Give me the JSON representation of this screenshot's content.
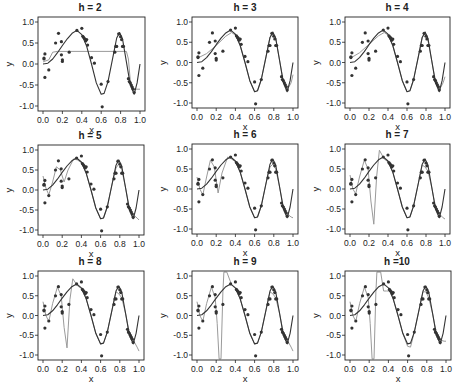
{
  "chart_data": {
    "type": "scatter",
    "layout": {
      "rows": 3,
      "cols": 3,
      "grid": false,
      "legend": "none"
    },
    "shared": {
      "xlabel": "x",
      "ylabel": "y",
      "xlim": [
        0.0,
        1.0
      ],
      "ylim": [
        -1.0,
        1.0
      ],
      "xticks": [
        "0.0",
        "0.2",
        "0.4",
        "0.6",
        "0.8",
        "1.0"
      ],
      "yticks": [
        "1.0",
        "0.5",
        "0.0",
        "-0.5",
        "-1.0"
      ],
      "points": [
        [
          0.01,
          0.14
        ],
        [
          0.01,
          0.12
        ],
        [
          0.02,
          0.24
        ],
        [
          0.02,
          -0.32
        ],
        [
          0.06,
          -0.14
        ],
        [
          0.13,
          0.5
        ],
        [
          0.16,
          0.73
        ],
        [
          0.19,
          0.53
        ],
        [
          0.19,
          0.22
        ],
        [
          0.2,
          0.1
        ],
        [
          0.2,
          0.06
        ],
        [
          0.27,
          0.28
        ],
        [
          0.35,
          0.8
        ],
        [
          0.4,
          0.85
        ],
        [
          0.41,
          0.66
        ],
        [
          0.42,
          0.63
        ],
        [
          0.43,
          0.6
        ],
        [
          0.44,
          0.55
        ],
        [
          0.45,
          0.58
        ],
        [
          0.46,
          0.45
        ],
        [
          0.5,
          0.15
        ],
        [
          0.53,
          0.02
        ],
        [
          0.6,
          -0.48
        ],
        [
          0.61,
          -1.02
        ],
        [
          0.67,
          -0.42
        ],
        [
          0.74,
          0.28
        ],
        [
          0.75,
          0.42
        ],
        [
          0.76,
          0.42
        ],
        [
          0.78,
          0.72
        ],
        [
          0.8,
          0.65
        ],
        [
          0.81,
          0.58
        ],
        [
          0.82,
          0.42
        ],
        [
          0.83,
          0.42
        ],
        [
          0.88,
          -0.35
        ],
        [
          0.89,
          -0.42
        ],
        [
          0.9,
          -0.45
        ],
        [
          0.91,
          -0.5
        ],
        [
          0.92,
          -0.55
        ],
        [
          0.93,
          -0.6
        ],
        [
          0.94,
          -0.68
        ]
      ],
      "true_curve": [
        [
          0.0,
          0.0
        ],
        [
          0.05,
          0.02
        ],
        [
          0.1,
          0.12
        ],
        [
          0.15,
          0.27
        ],
        [
          0.2,
          0.44
        ],
        [
          0.25,
          0.6
        ],
        [
          0.3,
          0.73
        ],
        [
          0.35,
          0.8
        ],
        [
          0.4,
          0.7
        ],
        [
          0.45,
          0.42
        ],
        [
          0.5,
          0.0
        ],
        [
          0.55,
          -0.45
        ],
        [
          0.6,
          -0.72
        ],
        [
          0.63,
          -0.7
        ],
        [
          0.67,
          -0.42
        ],
        [
          0.72,
          0.15
        ],
        [
          0.76,
          0.62
        ],
        [
          0.79,
          0.75
        ],
        [
          0.82,
          0.6
        ],
        [
          0.86,
          0.05
        ],
        [
          0.9,
          -0.5
        ],
        [
          0.94,
          -0.72
        ],
        [
          0.97,
          -0.45
        ],
        [
          1.0,
          0.0
        ]
      ]
    },
    "panels": [
      {
        "title": "h = 2",
        "h": 2,
        "fit": [
          [
            0.0,
            0.05
          ],
          [
            0.06,
            0.1
          ],
          [
            0.1,
            0.28
          ],
          [
            0.15,
            0.3
          ],
          [
            0.86,
            0.3
          ],
          [
            0.88,
            0.12
          ],
          [
            0.9,
            -0.4
          ],
          [
            0.93,
            -0.6
          ],
          [
            1.0,
            -0.6
          ]
        ]
      },
      {
        "title": "h = 3",
        "h": 3,
        "fit": [
          [
            0.0,
            0.1
          ],
          [
            0.1,
            0.22
          ],
          [
            0.2,
            0.42
          ],
          [
            0.3,
            0.65
          ],
          [
            0.36,
            0.74
          ],
          [
            0.4,
            0.68
          ],
          [
            0.45,
            0.42
          ],
          [
            0.5,
            0.0
          ],
          [
            0.55,
            -0.45
          ],
          [
            0.6,
            -0.72
          ],
          [
            0.63,
            -0.7
          ],
          [
            0.67,
            -0.42
          ],
          [
            0.72,
            0.15
          ],
          [
            0.76,
            0.62
          ],
          [
            0.79,
            0.72
          ],
          [
            0.82,
            0.6
          ],
          [
            0.86,
            0.05
          ],
          [
            0.9,
            -0.48
          ],
          [
            0.94,
            -0.68
          ],
          [
            0.98,
            -0.5
          ],
          [
            1.0,
            -0.3
          ]
        ]
      },
      {
        "title": "h = 4",
        "h": 4,
        "fit": [
          [
            0.0,
            0.1
          ],
          [
            0.1,
            0.24
          ],
          [
            0.2,
            0.45
          ],
          [
            0.3,
            0.66
          ],
          [
            0.36,
            0.74
          ],
          [
            0.4,
            0.68
          ],
          [
            0.45,
            0.42
          ],
          [
            0.5,
            0.0
          ],
          [
            0.55,
            -0.45
          ],
          [
            0.6,
            -0.72
          ],
          [
            0.63,
            -0.7
          ],
          [
            0.67,
            -0.42
          ],
          [
            0.72,
            0.15
          ],
          [
            0.76,
            0.62
          ],
          [
            0.79,
            0.72
          ],
          [
            0.82,
            0.55
          ],
          [
            0.86,
            0.05
          ],
          [
            0.9,
            -0.48
          ],
          [
            0.94,
            -0.68
          ],
          [
            0.98,
            -0.5
          ],
          [
            1.0,
            -0.35
          ]
        ]
      },
      {
        "title": "h = 5",
        "h": 5,
        "fit": [
          [
            0.0,
            0.35
          ],
          [
            0.03,
            0.05
          ],
          [
            0.06,
            -0.12
          ],
          [
            0.1,
            0.2
          ],
          [
            0.14,
            0.58
          ],
          [
            0.18,
            0.5
          ],
          [
            0.22,
            0.2
          ],
          [
            0.26,
            0.5
          ],
          [
            0.32,
            0.78
          ],
          [
            0.36,
            0.75
          ],
          [
            0.4,
            0.68
          ],
          [
            0.45,
            0.42
          ],
          [
            0.5,
            0.0
          ],
          [
            0.55,
            -0.45
          ],
          [
            0.6,
            -0.72
          ],
          [
            0.63,
            -0.7
          ],
          [
            0.67,
            -0.42
          ],
          [
            0.72,
            0.15
          ],
          [
            0.76,
            0.55
          ],
          [
            0.79,
            0.65
          ],
          [
            0.82,
            0.52
          ],
          [
            0.86,
            0.05
          ],
          [
            0.9,
            -0.45
          ],
          [
            0.94,
            -0.62
          ],
          [
            0.98,
            -0.7
          ],
          [
            1.0,
            -0.75
          ]
        ]
      },
      {
        "title": "h = 6",
        "h": 6,
        "fit": [
          [
            0.0,
            0.3
          ],
          [
            0.03,
            0.0
          ],
          [
            0.06,
            -0.15
          ],
          [
            0.1,
            0.3
          ],
          [
            0.14,
            0.72
          ],
          [
            0.18,
            0.55
          ],
          [
            0.22,
            -0.1
          ],
          [
            0.26,
            0.4
          ],
          [
            0.32,
            0.8
          ],
          [
            0.36,
            0.75
          ],
          [
            0.4,
            0.68
          ],
          [
            0.45,
            0.42
          ],
          [
            0.5,
            0.0
          ],
          [
            0.55,
            -0.45
          ],
          [
            0.6,
            -0.72
          ],
          [
            0.63,
            -0.7
          ],
          [
            0.67,
            -0.42
          ],
          [
            0.72,
            0.15
          ],
          [
            0.76,
            0.55
          ],
          [
            0.79,
            0.62
          ],
          [
            0.82,
            0.5
          ],
          [
            0.86,
            0.05
          ],
          [
            0.9,
            -0.45
          ],
          [
            0.94,
            -0.62
          ],
          [
            0.98,
            -0.7
          ],
          [
            1.0,
            -0.72
          ]
        ]
      },
      {
        "title": "h = 7",
        "h": 7,
        "fit": [
          [
            0.0,
            0.35
          ],
          [
            0.03,
            0.0
          ],
          [
            0.06,
            -0.12
          ],
          [
            0.1,
            0.3
          ],
          [
            0.15,
            0.72
          ],
          [
            0.19,
            0.5
          ],
          [
            0.22,
            -0.3
          ],
          [
            0.25,
            -0.88
          ],
          [
            0.28,
            0.3
          ],
          [
            0.31,
            0.97
          ],
          [
            0.36,
            0.75
          ],
          [
            0.4,
            0.68
          ],
          [
            0.45,
            0.42
          ],
          [
            0.5,
            0.0
          ],
          [
            0.55,
            -0.45
          ],
          [
            0.6,
            -0.72
          ],
          [
            0.63,
            -0.7
          ],
          [
            0.67,
            -0.42
          ],
          [
            0.72,
            0.15
          ],
          [
            0.76,
            0.6
          ],
          [
            0.79,
            0.55
          ],
          [
            0.82,
            0.45
          ],
          [
            0.86,
            0.05
          ],
          [
            0.9,
            -0.45
          ],
          [
            0.94,
            -0.62
          ],
          [
            0.98,
            -0.72
          ],
          [
            1.0,
            -0.75
          ]
        ]
      },
      {
        "title": "h = 8",
        "h": 8,
        "fit": [
          [
            0.0,
            0.35
          ],
          [
            0.03,
            0.0
          ],
          [
            0.06,
            -0.15
          ],
          [
            0.1,
            0.3
          ],
          [
            0.15,
            0.72
          ],
          [
            0.19,
            0.5
          ],
          [
            0.22,
            -0.3
          ],
          [
            0.25,
            -0.82
          ],
          [
            0.28,
            0.4
          ],
          [
            0.31,
            0.93
          ],
          [
            0.36,
            0.75
          ],
          [
            0.4,
            0.68
          ],
          [
            0.45,
            0.42
          ],
          [
            0.5,
            0.0
          ],
          [
            0.55,
            -0.45
          ],
          [
            0.6,
            -0.72
          ],
          [
            0.63,
            -0.7
          ],
          [
            0.67,
            -0.42
          ],
          [
            0.72,
            0.15
          ],
          [
            0.76,
            0.6
          ],
          [
            0.79,
            0.55
          ],
          [
            0.82,
            0.45
          ],
          [
            0.86,
            0.05
          ],
          [
            0.9,
            -0.45
          ],
          [
            0.94,
            -0.62
          ],
          [
            0.98,
            -0.8
          ],
          [
            1.0,
            -0.9
          ]
        ]
      },
      {
        "title": "h = 9",
        "h": 9,
        "fit": [
          [
            0.0,
            0.35
          ],
          [
            0.03,
            0.0
          ],
          [
            0.06,
            -0.15
          ],
          [
            0.1,
            0.3
          ],
          [
            0.15,
            0.72
          ],
          [
            0.19,
            0.45
          ],
          [
            0.21,
            -0.2
          ],
          [
            0.23,
            -1.1
          ],
          [
            0.25,
            -1.1
          ],
          [
            0.27,
            0.6
          ],
          [
            0.28,
            1.1
          ],
          [
            0.31,
            1.1
          ],
          [
            0.36,
            0.78
          ],
          [
            0.4,
            0.68
          ],
          [
            0.45,
            0.42
          ],
          [
            0.5,
            0.0
          ],
          [
            0.55,
            -0.45
          ],
          [
            0.6,
            -0.72
          ],
          [
            0.63,
            -0.7
          ],
          [
            0.67,
            -0.42
          ],
          [
            0.72,
            0.15
          ],
          [
            0.76,
            0.6
          ],
          [
            0.79,
            0.55
          ],
          [
            0.82,
            0.45
          ],
          [
            0.86,
            0.05
          ],
          [
            0.9,
            -0.45
          ],
          [
            0.94,
            -0.62
          ],
          [
            0.98,
            -0.8
          ],
          [
            1.0,
            -0.9
          ]
        ]
      },
      {
        "title": "h =10",
        "h": 10,
        "fit": [
          [
            0.0,
            0.35
          ],
          [
            0.03,
            0.0
          ],
          [
            0.06,
            -0.15
          ],
          [
            0.1,
            0.3
          ],
          [
            0.15,
            0.72
          ],
          [
            0.19,
            0.45
          ],
          [
            0.21,
            -0.2
          ],
          [
            0.23,
            -1.1
          ],
          [
            0.25,
            -1.1
          ],
          [
            0.27,
            0.6
          ],
          [
            0.28,
            1.1
          ],
          [
            0.32,
            1.1
          ],
          [
            0.35,
            0.62
          ],
          [
            0.38,
            0.62
          ],
          [
            0.42,
            0.62
          ],
          [
            0.45,
            0.42
          ],
          [
            0.5,
            0.0
          ],
          [
            0.55,
            -0.45
          ],
          [
            0.6,
            -0.78
          ],
          [
            0.63,
            -0.8
          ],
          [
            0.67,
            -0.42
          ],
          [
            0.72,
            0.15
          ],
          [
            0.76,
            0.6
          ],
          [
            0.79,
            0.6
          ],
          [
            0.82,
            0.45
          ],
          [
            0.86,
            0.05
          ],
          [
            0.9,
            -0.45
          ],
          [
            0.94,
            -0.62
          ],
          [
            0.98,
            -0.65
          ],
          [
            1.0,
            -0.65
          ]
        ]
      }
    ]
  },
  "colors": {
    "points": "#333333",
    "true_curve": "#333333",
    "fit_curve": "#9a9a9a",
    "frame": "#222222"
  }
}
